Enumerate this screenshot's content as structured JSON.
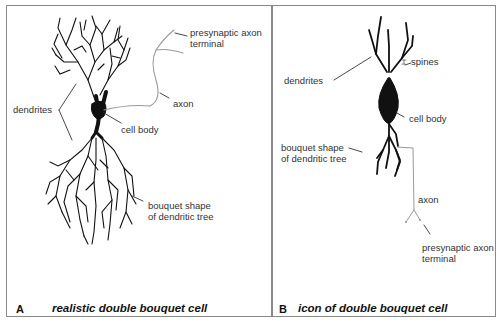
{
  "panels": [
    {
      "letter": "A",
      "caption": "realistic double bouquet cell",
      "labels": {
        "presynaptic_line1": "presynaptic axon",
        "presynaptic_line2": "terminal",
        "axon": "axon",
        "dendrites": "dendrites",
        "cell_body": "cell body",
        "bouquet_line1": "bouquet shape",
        "bouquet_line2": "of dendritic tree"
      }
    },
    {
      "letter": "B",
      "caption": "icon of double bouquet cell",
      "labels": {
        "spines": "spines",
        "dendrites": "dendrites",
        "cell_body": "cell body",
        "bouquet_line1": "bouquet shape",
        "bouquet_line2": "of dendritic tree",
        "axon": "axon",
        "presynaptic_line1": "presynaptic axon",
        "presynaptic_line2": "terminal"
      }
    }
  ],
  "colors": {
    "border": "#8a8a8a",
    "ink": "#111111",
    "axon": "#9a9a9a"
  }
}
